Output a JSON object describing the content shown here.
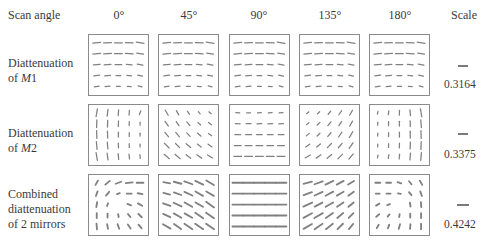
{
  "header": {
    "row_header": "Scan angle",
    "columns": [
      "0°",
      "45°",
      "90°",
      "135°",
      "180°"
    ],
    "scale_header": "Scale"
  },
  "rows": [
    {
      "label_lines": [
        "Diattenuation",
        "of "
      ],
      "label_italic": "M",
      "label_suffix": "1",
      "scale_value": "0.3164",
      "scale_bar_px": 10
    },
    {
      "label_lines": [
        "Diattenuation",
        "of "
      ],
      "label_italic": "M",
      "label_suffix": "2",
      "scale_value": "0.3375",
      "scale_bar_px": 10
    },
    {
      "label_lines": [
        "Combined",
        "diattenuation",
        "of 2 mirrors"
      ],
      "scale_value": "0.4242",
      "scale_bar_px": 12
    }
  ],
  "grid": {
    "rows": 5,
    "cols": 5,
    "line_color": "#808080",
    "border_color": "#8a8a8a",
    "description": "Each panel shows a 5x5 map of diattenuation orientation (angle in degrees from horizontal, positive = counterclockwise) and magnitude (segment length in px)"
  },
  "panels": [
    [
      {
        "angles": [
          [
            5,
            3,
            0,
            -3,
            -8
          ],
          [
            5,
            3,
            0,
            -3,
            -8
          ],
          [
            6,
            4,
            0,
            -4,
            -10
          ],
          [
            8,
            5,
            0,
            -5,
            -12
          ],
          [
            10,
            6,
            0,
            -6,
            -15
          ]
        ],
        "lengths": [
          [
            8,
            8,
            8,
            8,
            8
          ],
          [
            8,
            8,
            8,
            8,
            7
          ],
          [
            7,
            7,
            7,
            6,
            6
          ],
          [
            6,
            6,
            5,
            5,
            5
          ],
          [
            5,
            5,
            4,
            4,
            4
          ]
        ]
      },
      {
        "angles": [
          [
            5,
            3,
            0,
            -3,
            -8
          ],
          [
            5,
            3,
            0,
            -3,
            -8
          ],
          [
            6,
            4,
            0,
            -4,
            -10
          ],
          [
            8,
            5,
            0,
            -5,
            -12
          ],
          [
            10,
            6,
            0,
            -6,
            -15
          ]
        ],
        "lengths": [
          [
            8,
            8,
            8,
            8,
            8
          ],
          [
            8,
            8,
            8,
            8,
            7
          ],
          [
            7,
            7,
            7,
            6,
            6
          ],
          [
            6,
            6,
            5,
            5,
            5
          ],
          [
            5,
            5,
            4,
            4,
            4
          ]
        ]
      },
      {
        "angles": [
          [
            5,
            3,
            0,
            -3,
            -8
          ],
          [
            5,
            3,
            0,
            -3,
            -8
          ],
          [
            6,
            4,
            0,
            -4,
            -10
          ],
          [
            8,
            5,
            0,
            -5,
            -12
          ],
          [
            10,
            6,
            0,
            -6,
            -15
          ]
        ],
        "lengths": [
          [
            8,
            8,
            8,
            8,
            8
          ],
          [
            8,
            8,
            8,
            8,
            7
          ],
          [
            7,
            7,
            7,
            6,
            6
          ],
          [
            6,
            6,
            5,
            5,
            5
          ],
          [
            5,
            5,
            4,
            4,
            4
          ]
        ]
      },
      {
        "angles": [
          [
            5,
            3,
            0,
            -3,
            -8
          ],
          [
            5,
            3,
            0,
            -3,
            -8
          ],
          [
            6,
            4,
            0,
            -4,
            -10
          ],
          [
            8,
            5,
            0,
            -5,
            -12
          ],
          [
            10,
            6,
            0,
            -6,
            -15
          ]
        ],
        "lengths": [
          [
            8,
            8,
            8,
            8,
            8
          ],
          [
            8,
            8,
            8,
            8,
            7
          ],
          [
            7,
            7,
            7,
            6,
            6
          ],
          [
            6,
            6,
            5,
            5,
            5
          ],
          [
            5,
            5,
            4,
            4,
            4
          ]
        ]
      },
      {
        "angles": [
          [
            5,
            3,
            0,
            -3,
            -8
          ],
          [
            5,
            3,
            0,
            -3,
            -8
          ],
          [
            6,
            4,
            0,
            -4,
            -10
          ],
          [
            8,
            5,
            0,
            -5,
            -12
          ],
          [
            10,
            6,
            0,
            -6,
            -15
          ]
        ],
        "lengths": [
          [
            8,
            8,
            8,
            8,
            8
          ],
          [
            8,
            8,
            8,
            8,
            7
          ],
          [
            7,
            7,
            7,
            6,
            6
          ],
          [
            6,
            6,
            5,
            5,
            5
          ],
          [
            5,
            5,
            4,
            4,
            4
          ]
        ]
      }
    ],
    [
      {
        "angles": [
          [
            80,
            82,
            85,
            86,
            70
          ],
          [
            88,
            88,
            88,
            88,
            88
          ],
          [
            92,
            92,
            90,
            90,
            90
          ],
          [
            95,
            95,
            92,
            92,
            92
          ],
          [
            100,
            98,
            95,
            95,
            95
          ]
        ],
        "lengths": [
          [
            8,
            7,
            6,
            5,
            4
          ],
          [
            8,
            7,
            6,
            4,
            3
          ],
          [
            8,
            7,
            5,
            4,
            3
          ],
          [
            8,
            7,
            5,
            4,
            3
          ],
          [
            8,
            7,
            6,
            5,
            4
          ]
        ]
      },
      {
        "angles": [
          [
            -60,
            -60,
            -55,
            -50,
            -40
          ],
          [
            -55,
            -55,
            -50,
            -45,
            -40
          ],
          [
            -50,
            -50,
            -45,
            -40,
            -35
          ],
          [
            -45,
            -45,
            -40,
            -38,
            -35
          ],
          [
            -40,
            -40,
            -38,
            -35,
            -30
          ]
        ],
        "lengths": [
          [
            6,
            5,
            4,
            3,
            3
          ],
          [
            6,
            5,
            5,
            4,
            4
          ],
          [
            6,
            6,
            5,
            5,
            4
          ],
          [
            7,
            6,
            6,
            5,
            5
          ],
          [
            7,
            7,
            6,
            6,
            6
          ]
        ]
      },
      {
        "angles": [
          [
            -5,
            0,
            5,
            5,
            5
          ],
          [
            -3,
            0,
            3,
            3,
            3
          ],
          [
            0,
            0,
            0,
            0,
            0
          ],
          [
            0,
            0,
            0,
            0,
            0
          ],
          [
            0,
            0,
            0,
            0,
            0
          ]
        ],
        "lengths": [
          [
            4,
            4,
            4,
            4,
            4
          ],
          [
            5,
            5,
            5,
            5,
            5
          ],
          [
            6,
            6,
            6,
            6,
            6
          ],
          [
            7,
            7,
            7,
            7,
            7
          ],
          [
            8,
            8,
            8,
            8,
            8
          ]
        ]
      },
      {
        "angles": [
          [
            40,
            45,
            50,
            55,
            60
          ],
          [
            40,
            45,
            50,
            55,
            60
          ],
          [
            40,
            45,
            50,
            55,
            60
          ],
          [
            35,
            40,
            45,
            50,
            55
          ],
          [
            30,
            35,
            40,
            45,
            50
          ]
        ],
        "lengths": [
          [
            3,
            3,
            4,
            5,
            6
          ],
          [
            3,
            4,
            5,
            5,
            6
          ],
          [
            4,
            4,
            5,
            6,
            7
          ],
          [
            5,
            5,
            6,
            6,
            7
          ],
          [
            6,
            6,
            6,
            7,
            7
          ]
        ]
      },
      {
        "angles": [
          [
            80,
            82,
            88,
            95,
            100
          ],
          [
            85,
            88,
            90,
            92,
            95
          ],
          [
            88,
            88,
            90,
            90,
            92
          ],
          [
            88,
            88,
            88,
            88,
            88
          ],
          [
            80,
            82,
            85,
            86,
            85
          ]
        ],
        "lengths": [
          [
            3,
            4,
            5,
            6,
            8
          ],
          [
            3,
            4,
            5,
            6,
            8
          ],
          [
            3,
            4,
            5,
            7,
            8
          ],
          [
            3,
            4,
            5,
            7,
            8
          ],
          [
            3,
            4,
            5,
            7,
            8
          ]
        ]
      }
    ],
    [
      {
        "angles": [
          [
            60,
            40,
            20,
            5,
            0
          ],
          [
            70,
            50,
            20,
            0,
            -10
          ],
          [
            80,
            70,
            0,
            -20,
            -30
          ],
          [
            90,
            90,
            -80,
            -50,
            -45
          ],
          [
            95,
            100,
            -70,
            -55,
            -50
          ]
        ],
        "lengths": [
          [
            5,
            6,
            6,
            7,
            7
          ],
          [
            5,
            5,
            3,
            5,
            5
          ],
          [
            5,
            3,
            0,
            4,
            5
          ],
          [
            5,
            4,
            3,
            4,
            5
          ],
          [
            6,
            5,
            5,
            5,
            5
          ]
        ]
      },
      {
        "angles": [
          [
            -10,
            -15,
            -20,
            -25,
            -30
          ],
          [
            -15,
            -20,
            -25,
            -30,
            -30
          ],
          [
            -20,
            -25,
            -30,
            -30,
            -35
          ],
          [
            -25,
            -30,
            -30,
            -35,
            -35
          ],
          [
            -30,
            -35,
            -35,
            -35,
            -35
          ]
        ],
        "lengths": [
          [
            7,
            8,
            9,
            9,
            9
          ],
          [
            7,
            8,
            9,
            9,
            9
          ],
          [
            8,
            9,
            9,
            9,
            10
          ],
          [
            8,
            9,
            9,
            10,
            10
          ],
          [
            9,
            9,
            10,
            10,
            10
          ]
        ]
      },
      {
        "angles": [
          [
            0,
            0,
            0,
            0,
            0
          ],
          [
            0,
            0,
            0,
            0,
            0
          ],
          [
            0,
            0,
            0,
            0,
            0
          ],
          [
            0,
            0,
            0,
            0,
            0
          ],
          [
            0,
            0,
            0,
            0,
            0
          ]
        ],
        "lengths": [
          [
            11,
            11,
            11,
            11,
            11
          ],
          [
            11,
            11,
            11,
            11,
            11
          ],
          [
            11,
            11,
            11,
            11,
            11
          ],
          [
            11,
            11,
            11,
            11,
            11
          ],
          [
            11,
            11,
            11,
            11,
            11
          ]
        ]
      },
      {
        "angles": [
          [
            15,
            20,
            25,
            28,
            30
          ],
          [
            20,
            25,
            28,
            30,
            35
          ],
          [
            25,
            28,
            30,
            35,
            40
          ],
          [
            28,
            30,
            35,
            40,
            45
          ],
          [
            30,
            35,
            38,
            45,
            50
          ]
        ],
        "lengths": [
          [
            9,
            9,
            9,
            8,
            7
          ],
          [
            9,
            9,
            9,
            8,
            7
          ],
          [
            10,
            9,
            9,
            8,
            7
          ],
          [
            10,
            10,
            9,
            8,
            7
          ],
          [
            10,
            10,
            9,
            8,
            7
          ]
        ]
      },
      {
        "angles": [
          [
            0,
            0,
            -20,
            -50,
            -60
          ],
          [
            0,
            0,
            -10,
            -50,
            -70
          ],
          [
            30,
            20,
            0,
            -80,
            -85
          ],
          [
            40,
            50,
            80,
            90,
            90
          ],
          [
            60,
            70,
            75,
            85,
            90
          ]
        ],
        "lengths": [
          [
            5,
            5,
            4,
            4,
            5
          ],
          [
            4,
            4,
            3,
            4,
            5
          ],
          [
            4,
            3,
            0,
            4,
            5
          ],
          [
            4,
            3,
            3,
            4,
            5
          ],
          [
            4,
            4,
            5,
            5,
            6
          ]
        ]
      }
    ]
  ]
}
